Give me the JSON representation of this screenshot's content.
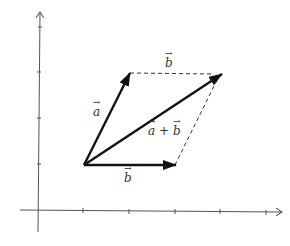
{
  "diagram": {
    "title": "",
    "type": "vector-addition-parallelogram",
    "labels": {
      "a": "a",
      "b_top": "b",
      "b_bottom": "b",
      "sum": "a + b",
      "sum_a": "a",
      "sum_plus": "+",
      "sum_b": "b"
    },
    "colors": {
      "axis": "#555555",
      "vector": "#111111",
      "dashed": "#333333",
      "text": "#333333"
    },
    "axes": {
      "x_ticks": 5,
      "y_ticks": 4
    },
    "vectors": [
      {
        "name": "a",
        "from": [
          1,
          1
        ],
        "to": [
          2,
          3
        ]
      },
      {
        "name": "b",
        "from": [
          1,
          1
        ],
        "to": [
          3,
          1
        ]
      },
      {
        "name": "a+b",
        "from": [
          1,
          1
        ],
        "to": [
          4,
          3
        ]
      }
    ],
    "dashed_edges": [
      {
        "name": "b-translated",
        "from": [
          2,
          3
        ],
        "to": [
          4,
          3
        ]
      },
      {
        "name": "a-translated",
        "from": [
          3,
          1
        ],
        "to": [
          4,
          3
        ]
      }
    ]
  }
}
